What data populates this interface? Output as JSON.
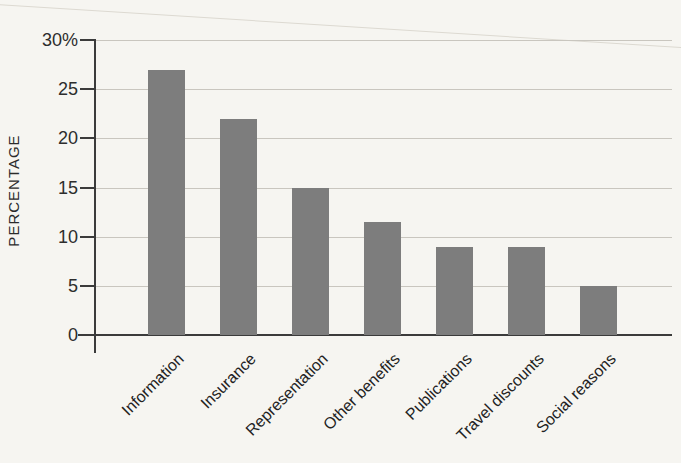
{
  "figure": {
    "background_color": "#f6f5f1",
    "bar_color": "#7d7d7d",
    "axis_color": "#3b3b3b",
    "gridline_color": "#c9c6bf",
    "text_color": "#2b2b2b"
  },
  "chart_data": {
    "type": "bar",
    "categories": [
      "Information",
      "Insurance",
      "Representation",
      "Other benefits",
      "Publications",
      "Travel discounts",
      "Social reasons"
    ],
    "values": [
      27,
      22,
      15,
      11.5,
      9,
      9,
      5
    ],
    "xlabel": "",
    "ylabel": "PERCENTAGE",
    "ylim": [
      0,
      30
    ],
    "ytick_values": [
      0,
      5,
      10,
      15,
      20,
      25,
      30
    ],
    "ytick_labels": [
      "0",
      "5",
      "10",
      "15",
      "20",
      "25",
      "30%"
    ],
    "gridline_values": [
      5,
      10,
      15,
      20,
      25,
      30
    ],
    "grid": "horizontal",
    "legend": "none",
    "x_label_rotation_deg": 45
  }
}
